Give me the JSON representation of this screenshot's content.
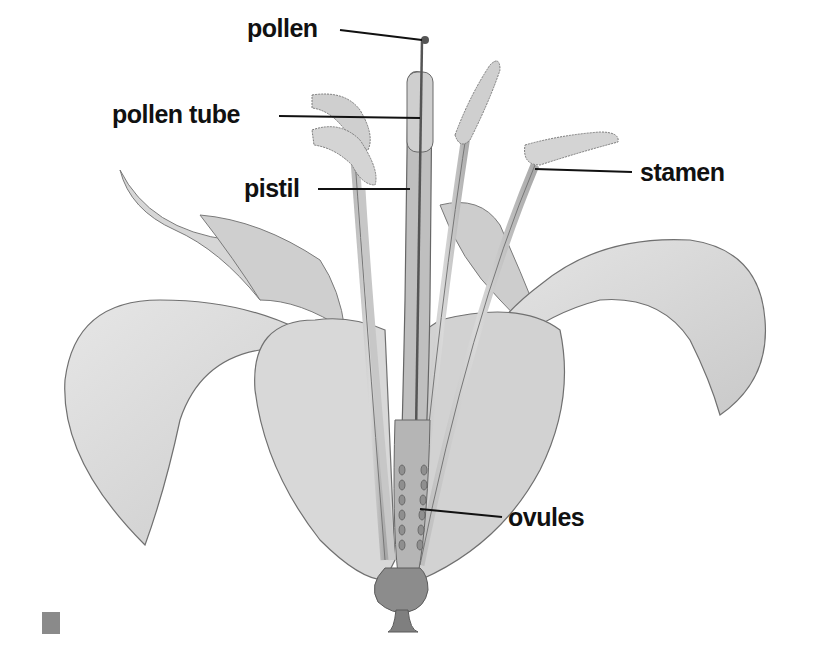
{
  "diagram": {
    "labels": [
      {
        "id": "pollen",
        "text": "pollen",
        "x": 247,
        "y": 16
      },
      {
        "id": "pollen-tube",
        "text": "pollen tube",
        "x": 112,
        "y": 102
      },
      {
        "id": "pistil",
        "text": "pistil",
        "x": 244,
        "y": 178
      },
      {
        "id": "stamen",
        "text": "stamen",
        "x": 640,
        "y": 164
      },
      {
        "id": "ovules",
        "text": "ovules",
        "x": 508,
        "y": 508
      }
    ],
    "leader_lines": [
      {
        "label": "pollen",
        "x1": 340,
        "y1": 30,
        "x2": 425,
        "y2": 40
      },
      {
        "label": "pollen-tube",
        "x1": 279,
        "y1": 116,
        "x2": 420,
        "y2": 118
      },
      {
        "label": "pistil",
        "x1": 318,
        "y1": 189,
        "x2": 410,
        "y2": 189
      },
      {
        "label": "stamen",
        "x1": 535,
        "y1": 169,
        "x2": 632,
        "y2": 172
      },
      {
        "label": "ovules",
        "x1": 420,
        "y1": 509,
        "x2": 502,
        "y2": 517
      }
    ],
    "colors": {
      "petal_fill": "#dcdcdc",
      "petal_shade": "#c4c4c4",
      "outline": "#6e6e6e",
      "stalk": "#8c8c8c",
      "label_text": "#111111",
      "marker": "#8a8a8a"
    }
  }
}
